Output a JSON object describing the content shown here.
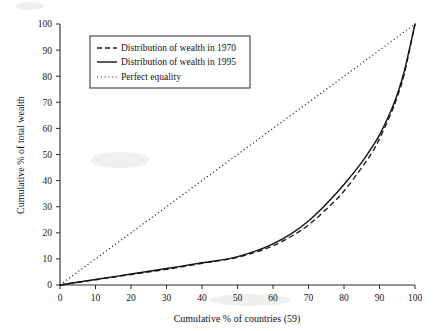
{
  "chart_data": {
    "type": "line",
    "title": "",
    "xlabel": "Cumulative % of countries (59)",
    "ylabel": "Cumulative % of total wealth",
    "xlim": [
      0,
      100
    ],
    "ylim": [
      0,
      100
    ],
    "grid": false,
    "legend_position": "upper-left",
    "xticks": [
      0,
      10,
      20,
      30,
      40,
      50,
      60,
      70,
      80,
      90,
      100
    ],
    "yticks": [
      0,
      10,
      20,
      30,
      40,
      50,
      60,
      70,
      80,
      90,
      100
    ],
    "xtick_labels": [
      "0",
      "10",
      "20",
      "30",
      "40",
      "50",
      "60",
      "70",
      "80",
      "90",
      "100"
    ],
    "ytick_labels": [
      "0",
      "10",
      "20",
      "30",
      "40",
      "50",
      "60",
      "70",
      "80",
      "90",
      "100"
    ],
    "series": [
      {
        "name": "Distribution of wealth in 1970",
        "style": "dashed",
        "color": "#1c1c1c",
        "x": [
          0,
          10,
          20,
          30,
          40,
          48,
          55,
          60,
          65,
          70,
          75,
          80,
          85,
          88,
          90,
          93,
          95,
          97,
          100
        ],
        "values": [
          0,
          2,
          4,
          6,
          8.3,
          10,
          12.5,
          15,
          18.5,
          23,
          29,
          36,
          45,
          51,
          56,
          65,
          72,
          81,
          100
        ]
      },
      {
        "name": "Distribution of wealth in 1995",
        "style": "solid",
        "color": "#121212",
        "x": [
          0,
          10,
          20,
          30,
          40,
          48,
          55,
          60,
          65,
          70,
          75,
          80,
          85,
          88,
          90,
          93,
          95,
          97,
          100
        ],
        "values": [
          0,
          2.1,
          4.2,
          6.3,
          8.5,
          10.2,
          13,
          15.8,
          19.5,
          24.5,
          31,
          38.5,
          47,
          53,
          57.5,
          66,
          73,
          82,
          100
        ]
      },
      {
        "name": "Perfect equality",
        "style": "dotted",
        "color": "#2b2b2b",
        "x": [
          0,
          100
        ],
        "values": [
          0,
          100
        ]
      }
    ]
  },
  "legend": {
    "items": [
      {
        "label": "Distribution of wealth in 1970",
        "marker": "dashed-line-marker"
      },
      {
        "label": "Distribution of wealth in 1995",
        "marker": "solid-line-marker"
      },
      {
        "label": "Perfect equality",
        "marker": "dotted-line-marker"
      }
    ]
  }
}
